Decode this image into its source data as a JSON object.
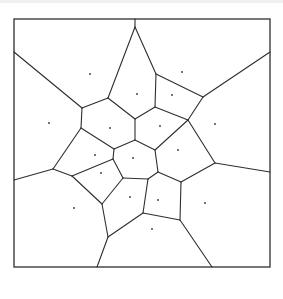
{
  "diagram": {
    "type": "voronoi",
    "frame": {
      "x": 14,
      "y": 19,
      "width": 256,
      "height": 248
    },
    "colors": {
      "stroke": "#2e2e2e",
      "background": "#ffffff",
      "site": "#333333"
    },
    "edges": [
      [
        [
          135,
          19
        ],
        [
          135,
          27
        ]
      ],
      [
        [
          135,
          27
        ],
        [
          108,
          98
        ]
      ],
      [
        [
          135,
          27
        ],
        [
          156,
          74
        ]
      ],
      [
        [
          14,
          52
        ],
        [
          82,
          108
        ]
      ],
      [
        [
          82,
          108
        ],
        [
          108,
          98
        ]
      ],
      [
        [
          108,
          98
        ],
        [
          135,
          119
        ]
      ],
      [
        [
          156,
          74
        ],
        [
          155,
          107
        ]
      ],
      [
        [
          156,
          74
        ],
        [
          203,
          97
        ]
      ],
      [
        [
          203,
          97
        ],
        [
          270,
          52
        ]
      ],
      [
        [
          203,
          97
        ],
        [
          188,
          120
        ]
      ],
      [
        [
          155,
          107
        ],
        [
          135,
          119
        ]
      ],
      [
        [
          155,
          107
        ],
        [
          188,
          120
        ]
      ],
      [
        [
          82,
          108
        ],
        [
          81,
          128
        ]
      ],
      [
        [
          81,
          128
        ],
        [
          114,
          149
        ]
      ],
      [
        [
          81,
          128
        ],
        [
          53,
          169
        ]
      ],
      [
        [
          135,
          119
        ],
        [
          135,
          140
        ]
      ],
      [
        [
          135,
          140
        ],
        [
          114,
          149
        ]
      ],
      [
        [
          135,
          140
        ],
        [
          155,
          150
        ]
      ],
      [
        [
          188,
          120
        ],
        [
          155,
          150
        ]
      ],
      [
        [
          188,
          120
        ],
        [
          215,
          163
        ]
      ],
      [
        [
          114,
          149
        ],
        [
          113,
          159
        ]
      ],
      [
        [
          113,
          159
        ],
        [
          72,
          176
        ]
      ],
      [
        [
          113,
          159
        ],
        [
          123,
          178
        ]
      ],
      [
        [
          155,
          150
        ],
        [
          158,
          172
        ]
      ],
      [
        [
          158,
          172
        ],
        [
          148,
          179
        ]
      ],
      [
        [
          158,
          172
        ],
        [
          181,
          182
        ]
      ],
      [
        [
          123,
          178
        ],
        [
          148,
          179
        ]
      ],
      [
        [
          123,
          178
        ],
        [
          102,
          204
        ]
      ],
      [
        [
          14,
          180
        ],
        [
          53,
          169
        ]
      ],
      [
        [
          53,
          169
        ],
        [
          72,
          176
        ]
      ],
      [
        [
          72,
          176
        ],
        [
          102,
          204
        ]
      ],
      [
        [
          215,
          163
        ],
        [
          270,
          172
        ]
      ],
      [
        [
          215,
          163
        ],
        [
          181,
          182
        ]
      ],
      [
        [
          148,
          179
        ],
        [
          143,
          213
        ]
      ],
      [
        [
          181,
          182
        ],
        [
          180,
          220
        ]
      ],
      [
        [
          143,
          213
        ],
        [
          180,
          220
        ]
      ],
      [
        [
          102,
          204
        ],
        [
          108,
          237
        ]
      ],
      [
        [
          108,
          237
        ],
        [
          143,
          213
        ]
      ],
      [
        [
          108,
          237
        ],
        [
          97,
          267
        ]
      ],
      [
        [
          180,
          220
        ],
        [
          212,
          267
        ]
      ]
    ],
    "sites": [
      [
        90,
        74
      ],
      [
        182,
        72
      ],
      [
        49,
        123
      ],
      [
        137,
        94
      ],
      [
        172,
        95
      ],
      [
        110,
        128
      ],
      [
        160,
        126
      ],
      [
        215,
        124
      ],
      [
        95,
        155
      ],
      [
        133,
        158
      ],
      [
        178,
        150
      ],
      [
        101,
        173
      ],
      [
        130,
        197
      ],
      [
        158,
        200
      ],
      [
        205,
        203
      ],
      [
        74,
        208
      ],
      [
        152,
        229
      ]
    ]
  }
}
